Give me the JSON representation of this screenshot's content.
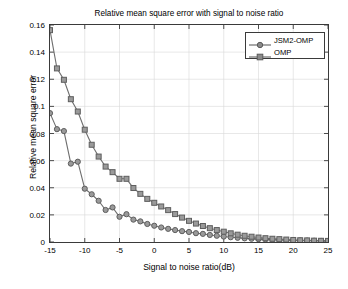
{
  "chart_data": {
    "type": "line",
    "title": "Relative mean square error with signal to noise ratio",
    "xlabel": "Signal to noise ratio(dB)",
    "ylabel": "Relative mean square error",
    "xlim": [
      -15,
      25
    ],
    "ylim": [
      0,
      0.16
    ],
    "xticks": [
      -15,
      -10,
      -5,
      0,
      5,
      10,
      15,
      20,
      25
    ],
    "xtick_labels": [
      "-15",
      "-10",
      "-5",
      "0",
      "5",
      "10",
      "15",
      "20",
      "25"
    ],
    "yticks": [
      0,
      0.02,
      0.04,
      0.06,
      0.08,
      0.1,
      0.12,
      0.14,
      0.16
    ],
    "ytick_labels": [
      "0",
      "0.02",
      "0.04",
      "0.06",
      "0.08",
      "0.1",
      "0.12",
      "0.14",
      "0.16"
    ],
    "grid": true,
    "legend_position": "top-right",
    "x": [
      -15,
      -14,
      -13,
      -12,
      -11,
      -10,
      -9,
      -8,
      -7,
      -6,
      -5,
      -4,
      -3,
      -2,
      -1,
      0,
      1,
      2,
      3,
      4,
      5,
      6,
      7,
      8,
      9,
      10,
      11,
      12,
      13,
      14,
      15,
      16,
      17,
      18,
      19,
      20,
      21,
      22,
      23,
      24,
      25
    ],
    "series": [
      {
        "name": "JSM2-OMP",
        "marker": "circle",
        "color": "#6e6e6e",
        "values": [
          0.095,
          0.0832,
          0.0818,
          0.0578,
          0.0592,
          0.0393,
          0.0352,
          0.0304,
          0.0236,
          0.0255,
          0.0186,
          0.0205,
          0.0165,
          0.0152,
          0.0133,
          0.012,
          0.0107,
          0.0097,
          0.0088,
          0.008,
          0.0074,
          0.0065,
          0.006,
          0.0052,
          0.0046,
          0.004,
          0.0035,
          0.0031,
          0.0027,
          0.0024,
          0.0021,
          0.0019,
          0.0017,
          0.0015,
          0.0013,
          0.0012,
          0.0011,
          0.001,
          0.0009,
          0.0008,
          0.0008
        ]
      },
      {
        "name": "OMP",
        "marker": "square",
        "color": "#6e6e6e",
        "values": [
          0.1562,
          0.128,
          0.1196,
          0.1053,
          0.0962,
          0.0828,
          0.0717,
          0.063,
          0.0556,
          0.0515,
          0.0466,
          0.0466,
          0.0398,
          0.0355,
          0.0318,
          0.0289,
          0.0262,
          0.0235,
          0.0206,
          0.018,
          0.0156,
          0.0136,
          0.0118,
          0.0102,
          0.0088,
          0.0076,
          0.0064,
          0.0054,
          0.0046,
          0.0039,
          0.0033,
          0.0028,
          0.0024,
          0.0021,
          0.0018,
          0.0015,
          0.0013,
          0.0012,
          0.001,
          0.0009,
          0.0008
        ]
      }
    ]
  },
  "legend": {
    "items": [
      {
        "label": "JSM2-OMP"
      },
      {
        "label": "OMP"
      }
    ]
  }
}
